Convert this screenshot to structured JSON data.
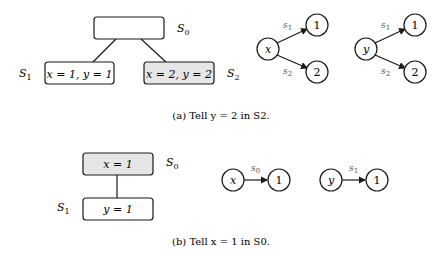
{
  "colors": {
    "stroke": "#1a1a1a",
    "highlight_fill": "#e6e6e6",
    "plain_fill": "#ffffff",
    "label": "#555555"
  },
  "figure_a": {
    "tree": {
      "root": {
        "label": "",
        "space": "S0"
      },
      "left": {
        "label": "x = 1, y = 1",
        "space": "S1",
        "highlighted": false
      },
      "right": {
        "label": "x = 2, y = 2",
        "space": "S2",
        "highlighted": true
      }
    },
    "graph_x": {
      "source": "x",
      "edges": [
        {
          "label": "s1",
          "target": "1"
        },
        {
          "label": "s2",
          "target": "2"
        }
      ]
    },
    "graph_y": {
      "source": "y",
      "edges": [
        {
          "label": "s1",
          "target": "1"
        },
        {
          "label": "s2",
          "target": "2"
        }
      ]
    },
    "caption": "(a) Tell y = 2 in S2."
  },
  "figure_b": {
    "tree": {
      "root": {
        "label": "x = 1",
        "space": "S0",
        "highlighted": true
      },
      "child": {
        "label": "y = 1",
        "space": "S1",
        "highlighted": false
      }
    },
    "graph_x": {
      "source": "x",
      "edges": [
        {
          "label": "s0",
          "target": "1"
        }
      ]
    },
    "graph_y": {
      "source": "y",
      "edges": [
        {
          "label": "s1",
          "target": "1"
        }
      ]
    },
    "caption": "(b) Tell x = 1 in S0."
  }
}
